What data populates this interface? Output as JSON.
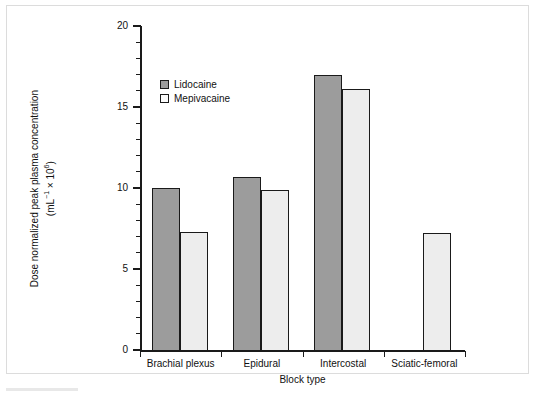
{
  "chart_data": {
    "type": "bar",
    "title": "",
    "xlabel": "Block type",
    "ylabel_line1": "Dose normalized peak plasma concentration",
    "ylabel_line2": "(mL−1 × 106)",
    "ylabel_plain": "Dose normalized peak plasma concentration (mL⁻¹ × 10⁶)",
    "categories": [
      "Brachial plexus",
      "Epidural",
      "Intercostal",
      "Sciatic-femoral"
    ],
    "series": [
      {
        "name": "Lidocaine",
        "color": "#9c9c9c",
        "values": [
          10.0,
          10.7,
          17.0,
          null
        ]
      },
      {
        "name": "Mepivacaine",
        "color": "#ededed",
        "values": [
          7.3,
          9.9,
          16.1,
          7.2
        ]
      }
    ],
    "ylim": [
      0,
      20
    ],
    "y_major_ticks": [
      0,
      5,
      10,
      15,
      20
    ],
    "y_major_tick_labels": [
      "0",
      "5",
      "10",
      "15",
      "20"
    ],
    "y_minor_tick_step": 1,
    "grid": false,
    "legend_position": "upper-left-inside"
  },
  "legend": {
    "entries": [
      {
        "label": "Lidocaine",
        "swatch": "dark-gray-swatch-icon"
      },
      {
        "label": "Mepivacaine",
        "swatch": "light-gray-swatch-icon"
      }
    ]
  }
}
